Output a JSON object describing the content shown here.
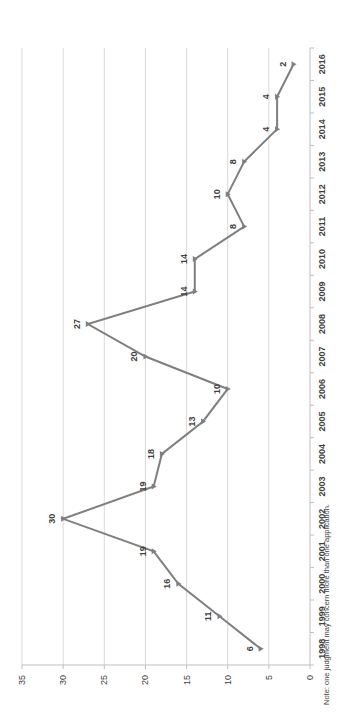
{
  "chart_data": {
    "type": "line",
    "title": "",
    "xlabel": "",
    "ylabel": "",
    "orientation": "rotated-90-ccw",
    "categories": [
      "1998",
      "1999",
      "2000",
      "2001",
      "2002",
      "2003",
      "2004",
      "2005",
      "2006",
      "2007",
      "2008",
      "2009",
      "2010",
      "2011",
      "2012",
      "2013",
      "2014",
      "2015",
      "2016"
    ],
    "series": [
      {
        "name": "Judgments",
        "values": [
          6,
          11,
          16,
          19,
          30,
          19,
          18,
          13,
          10,
          20,
          27,
          14,
          14,
          8,
          10,
          8,
          4,
          4,
          2
        ],
        "color": "#7f7f7f",
        "marker": "triangle"
      }
    ],
    "ylim": [
      0,
      35
    ],
    "yticks": [
      "0",
      "5",
      "10",
      "15",
      "20",
      "25",
      "30",
      "35"
    ],
    "grid": true,
    "data_labels": true,
    "legend": "none",
    "note": "Note: one judgment may concern more than one application."
  }
}
